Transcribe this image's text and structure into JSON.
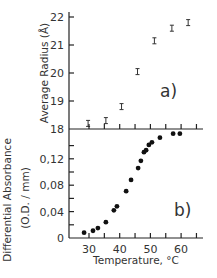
{
  "chart_data": [
    {
      "type": "scatter",
      "panel": "a)",
      "title": "",
      "xlabel": "Temperature, °C",
      "ylabel": "Average Radius (Å)",
      "xlim": [
        25,
        65
      ],
      "ylim": [
        18,
        22
      ],
      "yticks": [
        18,
        19,
        20,
        21,
        22
      ],
      "error_bars": true,
      "grid": false,
      "series": [
        {
          "name": "Average Radius",
          "marker": "error-bar",
          "x": [
            29.7,
            35.5,
            40.6,
            45.8,
            51.3,
            57.0,
            62.3
          ],
          "y": [
            18.2,
            18.3,
            18.8,
            20.05,
            21.15,
            21.6,
            21.8
          ]
        }
      ]
    },
    {
      "type": "scatter",
      "panel": "b)",
      "title": "",
      "xlabel": "Temperature, °C",
      "ylabel": "Differential Absorbance (O.D. / mm)",
      "xlim": [
        25,
        65
      ],
      "ylim": [
        0,
        0.16
      ],
      "xticks": [
        30,
        40,
        50,
        60
      ],
      "yticks": [
        0,
        0.04,
        0.08,
        0.12
      ],
      "grid": false,
      "series": [
        {
          "name": "Differential Absorbance",
          "marker": "filled-circle",
          "x": [
            28.4,
            31.3,
            32.9,
            35.5,
            38.1,
            39.1,
            42.1,
            43.7,
            46.0,
            46.9,
            47.9,
            48.6,
            49.5,
            50.5,
            53.1,
            57.4,
            59.6
          ],
          "y": [
            0.008,
            0.011,
            0.015,
            0.024,
            0.042,
            0.048,
            0.071,
            0.088,
            0.106,
            0.117,
            0.13,
            0.133,
            0.141,
            0.145,
            0.152,
            0.158,
            0.158
          ]
        }
      ]
    }
  ],
  "labels": {
    "panel_a": "a)",
    "panel_b": "b)",
    "y_a": "Average  Radius  (Å)",
    "y_b_line1": "Differential  Absorbance",
    "y_b_line2": "(O.D. / mm)",
    "x": "Temperature, °C",
    "yticks_a": [
      "22",
      "21",
      "20",
      "19",
      "18"
    ],
    "yticks_b": [
      "0,12",
      "0,08",
      "0,04",
      "0"
    ],
    "xticks": [
      "30",
      "40",
      "50",
      "60"
    ]
  }
}
